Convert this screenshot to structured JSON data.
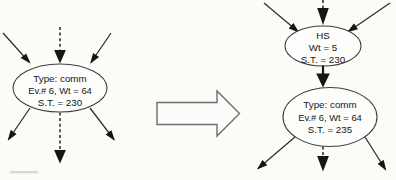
{
  "colors": {
    "background": "#fbfbf8",
    "edge_line": "#2d2d2d",
    "arrowhead": "#161616",
    "ellipse_stroke": "#3f3f3f",
    "block_arrow_stroke": "#6e6e6e",
    "text": "#161616"
  },
  "icons": {
    "transform": "hollow-right-block-arrow",
    "solid_edge": "thin-line-arrow",
    "dashed_edge": "dashed-line-heavy-arrow"
  },
  "before_node": {
    "type": "Type: comm",
    "event_weight": "Ev.# 6, Wt = 64",
    "start_time": "S.T. = 230"
  },
  "after_hs_node": {
    "name": "HS",
    "weight": "Wt = 5",
    "start_time": "S.T. = 230"
  },
  "after_comm_node": {
    "type": "Type: comm",
    "event_weight": "Ev.# 6, Wt = 64",
    "start_time": "S.T. = 235"
  }
}
